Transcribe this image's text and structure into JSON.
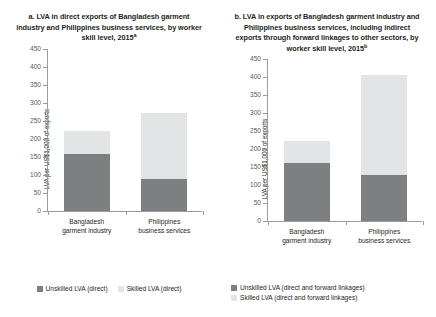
{
  "figure": {
    "background": "#ffffff",
    "colors": {
      "unskilled": "#7e7f81",
      "skilled": "#e3e4e5",
      "axis": "#9b9b9b",
      "text": "#231f20"
    }
  },
  "panel_a": {
    "title": "a. LVA in direct exports of Bangladesh garment industry and Philippines business services, by worker skill level, 2015",
    "title_superscript": "a",
    "ylabel": "LVA per US$1,000 of exports",
    "categories": [
      "Bangladesh garment industry",
      "Philippines business services"
    ],
    "legend": [
      {
        "label": "Unskilled LVA (direct)",
        "color": "#7e7f81"
      },
      {
        "label": "Skilled LVA (direct)",
        "color": "#e3e4e5"
      }
    ]
  },
  "panel_b": {
    "title": "b. LVA in exports of Bangladesh garment industry and Philippines business services, including indirect exports through forward linkages to other sectors, by worker skill level, 2015",
    "title_superscript": "b",
    "ylabel": "LVA per US$1,000 of exports",
    "categories": [
      "Bangladesh garment industry",
      "Philippines business services"
    ],
    "legend": [
      {
        "label": "Unskilled LVA (direct and forward linkages)",
        "color": "#7e7f81"
      },
      {
        "label": "Skilled LVA (direct and forward linkages)",
        "color": "#e3e4e5"
      }
    ]
  },
  "chart_data": [
    {
      "type": "bar",
      "stacked": true,
      "panel": "a",
      "title": "a. LVA in direct exports of Bangladesh garment industry and Philippines business services, by worker skill level, 2015a",
      "xlabel": "",
      "ylabel": "LVA per US$1,000 of exports",
      "ylim": [
        0,
        450
      ],
      "yticks": [
        0,
        50,
        100,
        150,
        200,
        250,
        300,
        350,
        400,
        450
      ],
      "grid": false,
      "legend_position": "bottom",
      "categories": [
        "Bangladesh garment industry",
        "Philippines business services"
      ],
      "series": [
        {
          "name": "Unskilled LVA (direct)",
          "values": [
            158,
            88
          ],
          "color": "#7e7f81"
        },
        {
          "name": "Skilled LVA (direct)",
          "values": [
            64,
            184
          ],
          "color": "#e3e4e5"
        }
      ],
      "totals": [
        222,
        272
      ]
    },
    {
      "type": "bar",
      "stacked": true,
      "panel": "b",
      "title": "b. LVA in exports of Bangladesh garment industry and Philippines business services, including indirect exports through forward linkages to other sectors, by worker skill level, 2015b",
      "xlabel": "",
      "ylabel": "LVA per US$1,000 of exports",
      "ylim": [
        0,
        450
      ],
      "yticks": [
        0,
        50,
        100,
        150,
        200,
        250,
        300,
        350,
        400,
        450
      ],
      "grid": false,
      "legend_position": "bottom",
      "categories": [
        "Bangladesh garment industry",
        "Philippines business services"
      ],
      "series": [
        {
          "name": "Unskilled LVA (direct and forward linkages)",
          "values": [
            160,
            127
          ],
          "color": "#7e7f81"
        },
        {
          "name": "Skilled LVA (direct and forward linkages)",
          "values": [
            62,
            278
          ],
          "color": "#e3e4e5"
        }
      ],
      "totals": [
        222,
        405
      ]
    }
  ]
}
